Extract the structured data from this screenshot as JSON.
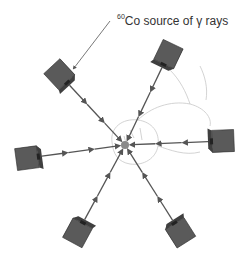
{
  "diagram": {
    "title_label": {
      "isotope_mass": "60",
      "text": "Co source of γ rays"
    },
    "focal_point": {
      "x": 125,
      "y": 145,
      "color": "#8a8a8a"
    },
    "colors": {
      "box_front": "#5a5a5a",
      "box_top": "#8a8a8a",
      "box_side": "#3f3f3f",
      "beam": "#555555",
      "head_outline": "#c8c8c8"
    },
    "sources": [
      {
        "id": "upper-left",
        "x": 60,
        "y": 75
      },
      {
        "id": "upper-right",
        "x": 168,
        "y": 55
      },
      {
        "id": "right",
        "x": 222,
        "y": 141
      },
      {
        "id": "left",
        "x": 28,
        "y": 158
      },
      {
        "id": "lower-left",
        "x": 78,
        "y": 232
      },
      {
        "id": "lower-right",
        "x": 180,
        "y": 232
      }
    ]
  }
}
